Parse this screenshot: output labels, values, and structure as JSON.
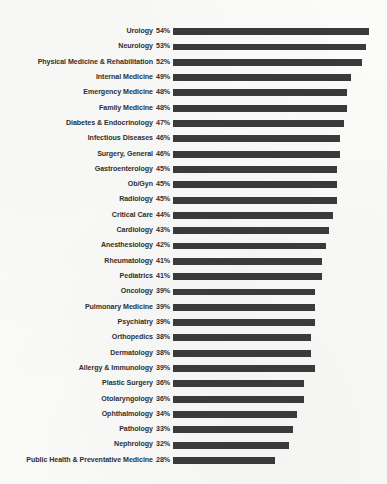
{
  "chart_data": {
    "type": "bar",
    "orientation": "horizontal",
    "title": "",
    "subtitle": "",
    "xlabel": "",
    "ylabel": "",
    "xlim": [
      0,
      54
    ],
    "grid": false,
    "legend": null,
    "value_suffix": "%",
    "bar_color": "#3a3a3a",
    "background_color": "#fbfbfa",
    "label_color": "#2f2f2f",
    "categories": [
      "Urology",
      "Neurology",
      "Physical Medicine & Rehabilitation",
      "Internal Medicine",
      "Emergency Medicine",
      "Family Medicine",
      "Diabetes & Endocrinology",
      "Infectious Diseases",
      "Surgery, General",
      "Gastroenterology",
      "Ob/Gyn",
      "Radiology",
      "Critical Care",
      "Cardiology",
      "Anesthesiology",
      "Rheumatology",
      "Pediatrics",
      "Oncology",
      "Pulmonary Medicine",
      "Psychiatry",
      "Orthopedics",
      "Dermatology",
      "Allergy & Immunology",
      "Plastic Surgery",
      "Otolaryngology",
      "Ophthalmology",
      "Pathology",
      "Nephrology",
      "Public Health & Preventative Medicine"
    ],
    "values": [
      54,
      53,
      52,
      49,
      48,
      48,
      47,
      46,
      46,
      45,
      45,
      45,
      44,
      43,
      42,
      41,
      41,
      39,
      39,
      39,
      38,
      38,
      39,
      36,
      36,
      34,
      33,
      32,
      28
    ],
    "value_labels": [
      "54%",
      "53%",
      "52%",
      "49%",
      "48%",
      "48%",
      "47%",
      "46%",
      "46%",
      "45%",
      "45%",
      "45%",
      "44%",
      "43%",
      "42%",
      "41%",
      "41%",
      "39%",
      "39%",
      "39%",
      "38%",
      "38%",
      "39%",
      "36%",
      "36%",
      "34%",
      "33%",
      "32%",
      "28%"
    ]
  }
}
